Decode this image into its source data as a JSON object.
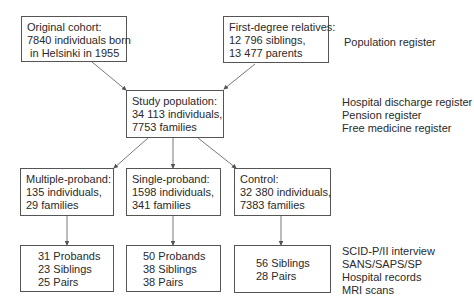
{
  "boxes": {
    "original_cohort": [
      "Original cohort:",
      "7840 individuals born",
      " in Helsinki in 1955"
    ],
    "first_degree": [
      "First-degree relatives:",
      "12 796 siblings,",
      "13 477 parents"
    ],
    "study_population": [
      "Study population:",
      "34 113 individuals,",
      "7753 families"
    ],
    "multiple_proband": [
      "Multiple-proband:",
      "135 individuals,",
      "29 families"
    ],
    "single_proband": [
      "Single-proband:",
      "1598 individuals,",
      "341 families"
    ],
    "control": [
      "Control:",
      "32 380 individuals,",
      "7383 families"
    ],
    "multiple_result": [
      "31 Probands",
      "23 Siblings",
      "25 Pairs"
    ],
    "single_result": [
      "50 Probands",
      "38 Siblings",
      "38 Pairs"
    ],
    "control_result": [
      "56 Siblings",
      "28 Pairs"
    ]
  },
  "side_labels": {
    "top": [
      "Population register"
    ],
    "middle": [
      "Hospital discharge register",
      "Pension register",
      "Free medicine register"
    ],
    "bottom": [
      "SCID-P/II interview",
      "SANS/SAPS/SP",
      "Hospital records",
      "MRI scans"
    ]
  },
  "colors": {
    "line": "#555555",
    "text": "#2a2a2a"
  }
}
